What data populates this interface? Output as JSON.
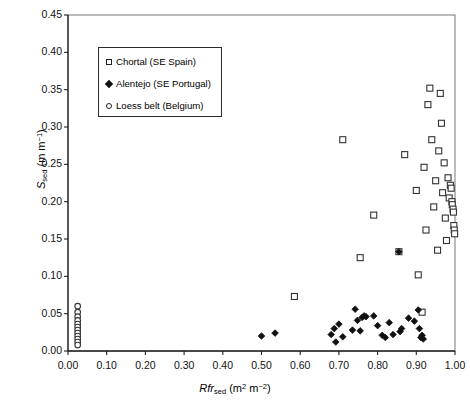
{
  "chart_data": {
    "type": "scatter",
    "title": "",
    "xlabel": "Rfr_sed (m2 m-2)",
    "ylabel": "S_sed (m m-1)",
    "xlim": [
      0.0,
      1.0
    ],
    "ylim": [
      0.0,
      0.45
    ],
    "grid": false,
    "legend_position": "upper-left-inside",
    "xticks": [
      "0.00",
      "0.10",
      "0.20",
      "0.30",
      "0.40",
      "0.50",
      "0.60",
      "0.70",
      "0.80",
      "0.90",
      "1.00"
    ],
    "yticks": [
      "0.00",
      "0.05",
      "0.10",
      "0.15",
      "0.20",
      "0.25",
      "0.30",
      "0.35",
      "0.40",
      "0.45"
    ],
    "series": [
      {
        "name": "Chortal (SE Spain)",
        "marker": "open-square",
        "color": "#ffffff",
        "edge": "#333333",
        "points": [
          [
            0.585,
            0.073
          ],
          [
            0.71,
            0.283
          ],
          [
            0.755,
            0.125
          ],
          [
            0.79,
            0.182
          ],
          [
            0.855,
            0.133
          ],
          [
            0.87,
            0.263
          ],
          [
            0.9,
            0.215
          ],
          [
            0.905,
            0.102
          ],
          [
            0.915,
            0.052
          ],
          [
            0.92,
            0.246
          ],
          [
            0.925,
            0.162
          ],
          [
            0.93,
            0.33
          ],
          [
            0.935,
            0.352
          ],
          [
            0.94,
            0.283
          ],
          [
            0.945,
            0.193
          ],
          [
            0.95,
            0.228
          ],
          [
            0.955,
            0.135
          ],
          [
            0.958,
            0.268
          ],
          [
            0.962,
            0.345
          ],
          [
            0.965,
            0.305
          ],
          [
            0.968,
            0.212
          ],
          [
            0.972,
            0.252
          ],
          [
            0.975,
            0.178
          ],
          [
            0.978,
            0.148
          ],
          [
            0.982,
            0.232
          ],
          [
            0.985,
            0.205
          ],
          [
            0.988,
            0.222
          ],
          [
            0.99,
            0.218
          ],
          [
            0.992,
            0.2
          ],
          [
            0.993,
            0.196
          ],
          [
            0.995,
            0.19
          ],
          [
            0.996,
            0.186
          ],
          [
            0.997,
            0.168
          ],
          [
            0.998,
            0.162
          ],
          [
            0.999,
            0.157
          ]
        ]
      },
      {
        "name": "Alentejo (SE Portugal)",
        "marker": "filled-diamond",
        "color": "#111111",
        "edge": "#111111",
        "points": [
          [
            0.5,
            0.02
          ],
          [
            0.535,
            0.024
          ],
          [
            0.68,
            0.022
          ],
          [
            0.688,
            0.03
          ],
          [
            0.692,
            0.012
          ],
          [
            0.7,
            0.036
          ],
          [
            0.71,
            0.019
          ],
          [
            0.735,
            0.028
          ],
          [
            0.742,
            0.056
          ],
          [
            0.748,
            0.041
          ],
          [
            0.755,
            0.027
          ],
          [
            0.76,
            0.045
          ],
          [
            0.765,
            0.047
          ],
          [
            0.77,
            0.046
          ],
          [
            0.79,
            0.047
          ],
          [
            0.8,
            0.034
          ],
          [
            0.812,
            0.021
          ],
          [
            0.82,
            0.018
          ],
          [
            0.83,
            0.038
          ],
          [
            0.84,
            0.022
          ],
          [
            0.855,
            0.133
          ],
          [
            0.858,
            0.026
          ],
          [
            0.862,
            0.03
          ],
          [
            0.88,
            0.044
          ],
          [
            0.895,
            0.04
          ],
          [
            0.905,
            0.055
          ],
          [
            0.908,
            0.03
          ],
          [
            0.912,
            0.018
          ],
          [
            0.915,
            0.021
          ],
          [
            0.918,
            0.016
          ]
        ]
      },
      {
        "name": "Loess belt (Belgium)",
        "marker": "open-circle",
        "color": "#ffffff",
        "edge": "#333333",
        "points": [
          [
            0.025,
            0.06
          ],
          [
            0.025,
            0.052
          ],
          [
            0.025,
            0.046
          ],
          [
            0.025,
            0.041
          ],
          [
            0.025,
            0.036
          ],
          [
            0.025,
            0.032
          ],
          [
            0.025,
            0.028
          ],
          [
            0.025,
            0.024
          ],
          [
            0.025,
            0.02
          ],
          [
            0.025,
            0.016
          ],
          [
            0.025,
            0.012
          ],
          [
            0.025,
            0.008
          ]
        ]
      }
    ]
  },
  "legend": {
    "items": [
      {
        "label": "Chortal (SE Spain)",
        "marker": "square"
      },
      {
        "label": "Alentejo (SE Portugal)",
        "marker": "diamond"
      },
      {
        "label": "Loess belt (Belgium)",
        "marker": "circle"
      }
    ]
  }
}
